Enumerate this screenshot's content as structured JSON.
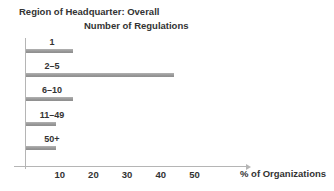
{
  "heading": "Region of Headquarter: Overall",
  "chart_data": {
    "type": "bar",
    "orientation": "horizontal",
    "title": "Number of Regulations",
    "categories": [
      "1",
      "2–5",
      "6–10",
      "11–49",
      "50+"
    ],
    "values": [
      14,
      44,
      14,
      9,
      9
    ],
    "xlabel": "% of Organizations",
    "xticks": [
      10,
      20,
      30,
      40,
      50
    ],
    "xlim": [
      0,
      65
    ],
    "grid": false,
    "legend": false,
    "bar_color": "#989898",
    "axis_color": "#b5b5b5",
    "text_color": "#333333"
  }
}
